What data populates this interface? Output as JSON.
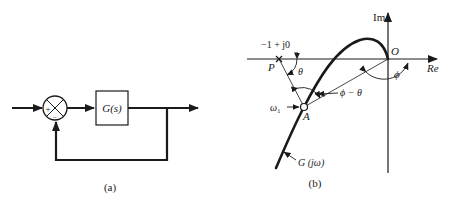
{
  "figure_a": {
    "caption": "(a)",
    "block_label": "G(s)",
    "summing_plus": "+",
    "summing_minus": "−"
  },
  "figure_b": {
    "caption": "(b)",
    "axis_im": "Im",
    "axis_re": "Re",
    "origin_label": "O",
    "critical_point_label": "−1 + j0",
    "point_p_label": "P",
    "point_a_label": "A",
    "omega_label": "ω",
    "omega_subscript": "1",
    "theta_label": "θ",
    "phi_label": "ϕ",
    "phi_minus_theta_label": "ϕ − θ",
    "curve_label": "G (jω)"
  },
  "colors": {
    "ink": "#1a1a1a",
    "background": "#ffffff"
  }
}
